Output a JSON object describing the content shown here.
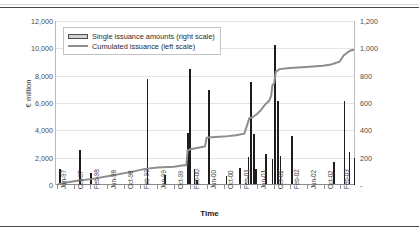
{
  "chart_data": {
    "type": "bar",
    "title": "",
    "xlabel": "Time",
    "ylabel": "€ million",
    "y_left_ticks": [
      "0",
      "2,000",
      "4,000",
      "6,000",
      "8,000",
      "10,000",
      "12,000"
    ],
    "y_right_ticks": [
      "-",
      "200",
      "400",
      "600",
      "800",
      "1,000",
      "1,200"
    ],
    "ylim_left": [
      0,
      12000
    ],
    "ylim_right": [
      0,
      1200
    ],
    "grid": true,
    "legend_position": "top-left",
    "legend": [
      {
        "label": "Single issuance amounts (right scale)",
        "marker": "bar",
        "color": "#d2d2d2"
      },
      {
        "label": "Cumulated issuance (left scale)",
        "marker": "line",
        "color": "#8d8d8d"
      }
    ],
    "categories": [
      "Jun-97",
      "Oct-97",
      "Feb-98",
      "Jun-98",
      "Oct-98",
      "Feb-99",
      "Jun-99",
      "Oct-99",
      "Feb-00",
      "Jun-00",
      "Oct-00",
      "Feb-01",
      "Jun-01",
      "Oct-01",
      "Feb-02",
      "Jun-02",
      "Oct-02",
      "Feb-03"
    ],
    "series": [
      {
        "name": "Single issuance amounts (right scale)",
        "axis": "right",
        "unit": "€ million",
        "type": "bar",
        "points": [
          {
            "t": 0.5,
            "v": 115
          },
          {
            "t": 10.0,
            "v": 253
          },
          {
            "t": 15.5,
            "v": 88
          },
          {
            "t": 42.5,
            "v": 775
          },
          {
            "t": 51.0,
            "v": 72
          },
          {
            "t": 62.0,
            "v": 382
          },
          {
            "t": 62.9,
            "v": 848
          },
          {
            "t": 65.0,
            "v": 120
          },
          {
            "t": 66.4,
            "v": 36
          },
          {
            "t": 72.0,
            "v": 698
          },
          {
            "t": 80.5,
            "v": 63
          },
          {
            "t": 87.0,
            "v": 126
          },
          {
            "t": 89.5,
            "v": 18
          },
          {
            "t": 91.0,
            "v": 205
          },
          {
            "t": 92.2,
            "v": 755
          },
          {
            "t": 93.6,
            "v": 375
          },
          {
            "t": 94.6,
            "v": 120
          },
          {
            "t": 99.5,
            "v": 224
          },
          {
            "t": 102.5,
            "v": 188
          },
          {
            "t": 103.8,
            "v": 1022
          },
          {
            "t": 105.2,
            "v": 618
          },
          {
            "t": 106.3,
            "v": 212
          },
          {
            "t": 112.0,
            "v": 360
          },
          {
            "t": 132.0,
            "v": 165
          },
          {
            "t": 137.0,
            "v": 613
          },
          {
            "t": 139.5,
            "v": 240
          },
          {
            "t": 141.8,
            "v": 200
          }
        ]
      },
      {
        "name": "Cumulated issuance (left scale)",
        "axis": "left",
        "unit": "€ million",
        "type": "line",
        "points": [
          {
            "t": 0,
            "v": 60
          },
          {
            "t": 4,
            "v": 180
          },
          {
            "t": 10,
            "v": 330
          },
          {
            "t": 16,
            "v": 430
          },
          {
            "t": 26,
            "v": 700
          },
          {
            "t": 36,
            "v": 980
          },
          {
            "t": 42,
            "v": 1180
          },
          {
            "t": 48,
            "v": 1280
          },
          {
            "t": 56,
            "v": 1340
          },
          {
            "t": 60,
            "v": 1420
          },
          {
            "t": 62,
            "v": 1460
          },
          {
            "t": 62.6,
            "v": 2540
          },
          {
            "t": 64,
            "v": 2620
          },
          {
            "t": 67,
            "v": 2700
          },
          {
            "t": 69,
            "v": 2760
          },
          {
            "t": 71,
            "v": 2820
          },
          {
            "t": 71.8,
            "v": 3460
          },
          {
            "t": 74,
            "v": 3500
          },
          {
            "t": 80,
            "v": 3540
          },
          {
            "t": 86,
            "v": 3640
          },
          {
            "t": 90,
            "v": 3760
          },
          {
            "t": 91.4,
            "v": 4400
          },
          {
            "t": 92.4,
            "v": 4880
          },
          {
            "t": 94,
            "v": 4960
          },
          {
            "t": 96,
            "v": 5180
          },
          {
            "t": 98,
            "v": 5480
          },
          {
            "t": 100,
            "v": 5880
          },
          {
            "t": 102,
            "v": 6160
          },
          {
            "t": 103,
            "v": 6540
          },
          {
            "t": 103.6,
            "v": 7320
          },
          {
            "t": 104.4,
            "v": 7420
          },
          {
            "t": 105.2,
            "v": 8280
          },
          {
            "t": 107,
            "v": 8480
          },
          {
            "t": 112,
            "v": 8560
          },
          {
            "t": 120,
            "v": 8640
          },
          {
            "t": 128,
            "v": 8720
          },
          {
            "t": 132,
            "v": 8820
          },
          {
            "t": 136,
            "v": 9020
          },
          {
            "t": 138,
            "v": 9480
          },
          {
            "t": 141,
            "v": 9820
          },
          {
            "t": 143,
            "v": 9900
          }
        ]
      }
    ]
  }
}
